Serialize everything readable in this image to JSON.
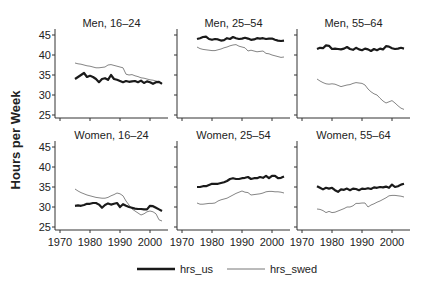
{
  "chart_data": {
    "type": "line",
    "ylabel": "Hours per Week",
    "xlabel": "",
    "xlim": [
      1970,
      2005
    ],
    "ylim": [
      25,
      45
    ],
    "xticks": [
      1970,
      1980,
      1990,
      2000
    ],
    "yticks": [
      25,
      30,
      35,
      40,
      45
    ],
    "grid": false,
    "legend": {
      "position": "bottom",
      "entries": [
        {
          "name": "hrs_us",
          "style": "thick",
          "color": "#1a1a1a"
        },
        {
          "name": "hrs_swed",
          "style": "thin",
          "color": "#777777"
        }
      ]
    },
    "x": [
      1975,
      1976,
      1977,
      1978,
      1979,
      1980,
      1981,
      1982,
      1983,
      1984,
      1985,
      1986,
      1987,
      1988,
      1989,
      1990,
      1991,
      1992,
      1993,
      1994,
      1995,
      1996,
      1997,
      1998,
      1999,
      2000,
      2001,
      2002,
      2003,
      2004
    ],
    "panels": [
      {
        "title": "Men, 16–24",
        "row": 0,
        "col": 0,
        "series": [
          {
            "name": "hrs_us",
            "values": [
              34,
              34.5,
              35,
              35.5,
              34.5,
              34.8,
              34.5,
              34,
              33.2,
              34,
              34.2,
              33.8,
              35,
              34,
              33.8,
              33.5,
              33.2,
              33.5,
              33.3,
              33.4,
              33.5,
              33.2,
              33.6,
              33,
              33.4,
              33.2,
              32.8,
              33.2,
              33.3,
              32.8
            ]
          },
          {
            "name": "hrs_swed",
            "values": [
              38,
              37.8,
              37.7,
              37.5,
              37.3,
              37.2,
              37,
              36.8,
              36.8,
              36.9,
              37,
              37.5,
              37.6,
              37.4,
              37.2,
              37,
              36.8,
              35.2,
              35,
              35.1,
              34.8,
              34.6,
              34.3,
              34.2,
              34,
              33.8,
              33.7,
              33.5,
              33.2,
              33
            ]
          }
        ]
      },
      {
        "title": "Men, 25–54",
        "row": 0,
        "col": 1,
        "series": [
          {
            "name": "hrs_us",
            "values": [
              44,
              44.2,
              44.5,
              44.6,
              44,
              43.8,
              44,
              43.9,
              43.6,
              43.7,
              44.2,
              44,
              44.5,
              44.2,
              44,
              44.1,
              44.3,
              44.1,
              43.8,
              43.9,
              44.2,
              44.1,
              44.2,
              44,
              44.1,
              44.1,
              43.8,
              43.6,
              43.5,
              43.6
            ]
          },
          {
            "name": "hrs_swed",
            "values": [
              42,
              41.6,
              41.4,
              41.3,
              41.2,
              41.1,
              41.1,
              41.3,
              41.5,
              41.8,
              42,
              42.3,
              42.5,
              42.6,
              42.2,
              42,
              41.8,
              41,
              41.2,
              41,
              40.8,
              40.9,
              41,
              40.4,
              40.3,
              40,
              39.8,
              39.6,
              39.4,
              39.5
            ]
          }
        ]
      },
      {
        "title": "Men, 55–64",
        "row": 0,
        "col": 2,
        "series": [
          {
            "name": "hrs_us",
            "values": [
              41.5,
              41.8,
              41.7,
              42.4,
              42.3,
              41.5,
              41.6,
              41.5,
              41.4,
              41.6,
              42,
              41.5,
              41.3,
              41.8,
              41.4,
              41.2,
              41.6,
              41.4,
              41,
              41.5,
              41.2,
              41.6,
              41.4,
              42.2,
              42.1,
              41.7,
              41.5,
              41.6,
              41.8,
              41.6
            ]
          },
          {
            "name": "hrs_swed",
            "values": [
              34,
              33.5,
              33.1,
              32.8,
              32.7,
              32.8,
              32.7,
              32.4,
              32.1,
              32.3,
              32.5,
              32.6,
              32.9,
              33.1,
              33,
              32.9,
              32.5,
              31.5,
              30.8,
              30.3,
              30,
              29.2,
              28.5,
              28,
              28.3,
              28.6,
              28,
              27.3,
              26.7,
              26.4
            ]
          }
        ]
      },
      {
        "title": "Women, 16–24",
        "row": 1,
        "col": 0,
        "series": [
          {
            "name": "hrs_us",
            "values": [
              30.3,
              30.4,
              30.3,
              30.5,
              30.8,
              30.8,
              31,
              31,
              30.6,
              29.8,
              30.5,
              30.9,
              30.6,
              30.8,
              31,
              30,
              30.7,
              30.3,
              30,
              29.8,
              29.6,
              29.5,
              29.5,
              29.4,
              29.4,
              30.3,
              30.2,
              29.8,
              29.4,
              29
            ]
          },
          {
            "name": "hrs_swed",
            "values": [
              34.5,
              34,
              33.6,
              33.3,
              33,
              32.8,
              32.6,
              32.4,
              32.3,
              32.2,
              32.2,
              32.4,
              32.8,
              33.1,
              33.5,
              33.3,
              32.8,
              31.5,
              30.5,
              29.5,
              29,
              28.5,
              28,
              28.3,
              28.8,
              29,
              28.8,
              28.3,
              26.8,
              26.5
            ]
          }
        ]
      },
      {
        "title": "Women, 25–54",
        "row": 1,
        "col": 1,
        "series": [
          {
            "name": "hrs_us",
            "values": [
              35,
              35,
              35.2,
              35.2,
              35.5,
              35.8,
              35.8,
              35.8,
              36,
              36.2,
              36.5,
              37,
              37.2,
              37,
              37,
              37.2,
              37.3,
              37.5,
              37,
              37.2,
              37.2,
              37.5,
              37.3,
              37.8,
              37.2,
              37.8,
              37.8,
              37.2,
              37.3,
              37.6
            ]
          },
          {
            "name": "hrs_swed",
            "values": [
              31,
              30.7,
              30.7,
              30.8,
              30.9,
              30.9,
              31,
              31.5,
              31.8,
              32,
              32.2,
              32.6,
              33,
              33.4,
              33.7,
              34,
              33.7,
              33.6,
              33,
              33.1,
              33.2,
              33.3,
              33.5,
              33.8,
              33.9,
              33.9,
              33.8,
              33.8,
              33.7,
              33.5
            ]
          }
        ]
      },
      {
        "title": "Women, 55–64",
        "row": 1,
        "col": 2,
        "series": [
          {
            "name": "hrs_us",
            "values": [
              35.2,
              34.8,
              34.4,
              34.8,
              34.6,
              34.8,
              34.2,
              33.8,
              34.4,
              34.3,
              34.6,
              34.2,
              34.6,
              34.5,
              34.2,
              34.6,
              34.5,
              34.7,
              34.5,
              34.9,
              34.8,
              35,
              34.9,
              35.1,
              34.8,
              35.6,
              35,
              35.2,
              35.6,
              35.8
            ]
          },
          {
            "name": "hrs_swed",
            "values": [
              29.5,
              29.4,
              29.1,
              28.6,
              28.9,
              28.6,
              28.7,
              29,
              29.3,
              29.6,
              30,
              30,
              30.3,
              30.9,
              30.9,
              31,
              31,
              30,
              30.5,
              30.8,
              31.2,
              31.5,
              31.9,
              32.3,
              32.8,
              32.9,
              32.9,
              32.8,
              32.7,
              32.5
            ]
          }
        ]
      }
    ]
  }
}
